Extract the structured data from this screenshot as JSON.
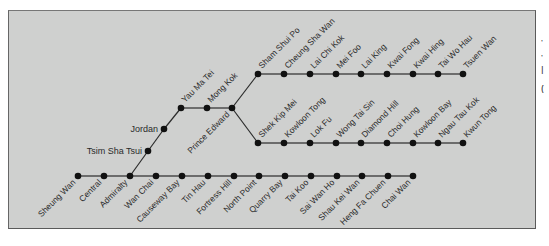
{
  "diagram": {
    "colors": {
      "background": "#cfd0cf",
      "line": "#2b2b2b",
      "station": "#111111",
      "label": "#2a2a2a"
    },
    "lines": [
      {
        "id": "island-line",
        "stations": [
          {
            "name": "Sheung Wan",
            "x": 78,
            "y": 176,
            "label_side": "below"
          },
          {
            "name": "Central",
            "x": 104,
            "y": 176,
            "label_side": "below"
          },
          {
            "name": "Admiralty",
            "x": 130,
            "y": 176,
            "label_side": "below"
          },
          {
            "name": "Wan Chai",
            "x": 156,
            "y": 176,
            "label_side": "below"
          },
          {
            "name": "Causeway Bay",
            "x": 182,
            "y": 176,
            "label_side": "below"
          },
          {
            "name": "Tin Hau",
            "x": 208,
            "y": 176,
            "label_side": "below"
          },
          {
            "name": "Fortress Hill",
            "x": 234,
            "y": 176,
            "label_side": "below"
          },
          {
            "name": "North Point",
            "x": 259,
            "y": 176,
            "label_side": "below"
          },
          {
            "name": "Quarry Bay",
            "x": 285,
            "y": 176,
            "label_side": "below"
          },
          {
            "name": "Tai Koo",
            "x": 311,
            "y": 176,
            "label_side": "below"
          },
          {
            "name": "Sai Wan Ho",
            "x": 337,
            "y": 176,
            "label_side": "below"
          },
          {
            "name": "Shau Kei Wan",
            "x": 362,
            "y": 176,
            "label_side": "below"
          },
          {
            "name": "Heng Fa Chuen",
            "x": 388,
            "y": 176,
            "label_side": "below"
          },
          {
            "name": "Chai Wan",
            "x": 413,
            "y": 176,
            "label_side": "below"
          }
        ]
      },
      {
        "id": "nathan-road-trunk",
        "stations": [
          {
            "name": "Tsim Sha Tsui",
            "x": 148,
            "y": 151,
            "label_side": "left"
          },
          {
            "name": "Jordan",
            "x": 164,
            "y": 129,
            "label_side": "left"
          },
          {
            "name": "Yau Ma Tei",
            "x": 181,
            "y": 108,
            "label_side": "above"
          },
          {
            "name": "Mong Kok",
            "x": 207,
            "y": 108,
            "label_side": "above"
          },
          {
            "name": "Prince Edward",
            "x": 232,
            "y": 108,
            "label_side": "below"
          }
        ]
      },
      {
        "id": "tsuen-wan-branch",
        "stations": [
          {
            "name": "Sham Shui Po",
            "x": 258,
            "y": 74,
            "label_side": "above"
          },
          {
            "name": "Cheung Sha Wan",
            "x": 284,
            "y": 74,
            "label_side": "above"
          },
          {
            "name": "Lai Chi Kok",
            "x": 310,
            "y": 74,
            "label_side": "above"
          },
          {
            "name": "Mei Foo",
            "x": 336,
            "y": 74,
            "label_side": "above"
          },
          {
            "name": "Lai King",
            "x": 361,
            "y": 74,
            "label_side": "above"
          },
          {
            "name": "Kwai Fong",
            "x": 387,
            "y": 74,
            "label_side": "above"
          },
          {
            "name": "Kwai Hing",
            "x": 413,
            "y": 74,
            "label_side": "above"
          },
          {
            "name": "Tai Wo Hau",
            "x": 438,
            "y": 74,
            "label_side": "above"
          },
          {
            "name": "Tsuen Wan",
            "x": 463,
            "y": 74,
            "label_side": "above"
          }
        ]
      },
      {
        "id": "kwun-tong-branch",
        "stations": [
          {
            "name": "Shek Kip Mei",
            "x": 258,
            "y": 143,
            "label_side": "above"
          },
          {
            "name": "Kowloon Tong",
            "x": 284,
            "y": 143,
            "label_side": "above"
          },
          {
            "name": "Lok Fu",
            "x": 310,
            "y": 143,
            "label_side": "above"
          },
          {
            "name": "Wong Tai Sin",
            "x": 336,
            "y": 143,
            "label_side": "above"
          },
          {
            "name": "Diamond Hill",
            "x": 361,
            "y": 143,
            "label_side": "above"
          },
          {
            "name": "Choi Hung",
            "x": 387,
            "y": 143,
            "label_side": "above"
          },
          {
            "name": "Kowloon Bay",
            "x": 413,
            "y": 143,
            "label_side": "above"
          },
          {
            "name": "Ngau Tau Kok",
            "x": 438,
            "y": 143,
            "label_side": "above"
          },
          {
            "name": "Kwun Tong",
            "x": 463,
            "y": 143,
            "label_side": "above"
          }
        ]
      }
    ],
    "connections": [
      {
        "from": "Admiralty",
        "to": "Tsim Sha Tsui"
      },
      {
        "from": "Prince Edward",
        "to": "Sham Shui Po"
      },
      {
        "from": "Prince Edward",
        "to": "Shek Kip Mei"
      }
    ]
  },
  "side_text": [
    "'",
    "'",
    "|",
    "("
  ]
}
